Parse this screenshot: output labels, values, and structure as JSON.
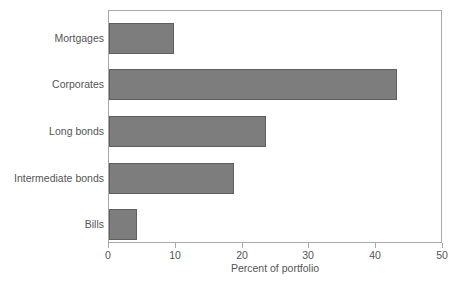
{
  "chart_data": {
    "type": "bar",
    "orientation": "horizontal",
    "title": "",
    "subtitle": "",
    "categories": [
      "Mortgages",
      "Corporates",
      "Long bonds",
      "Intermediate bonds",
      "Bills"
    ],
    "values": [
      9.8,
      43.1,
      23.5,
      18.7,
      4.2
    ],
    "xlabel": "Percent of portfolio",
    "ylabel": "",
    "xlim": [
      0,
      50
    ],
    "xticks": [
      0,
      10,
      20,
      30,
      40,
      50
    ],
    "xtick_labels": [
      "0",
      "10",
      "20",
      "30",
      "40",
      "50"
    ],
    "grid": false,
    "legend": null,
    "legend_position": "none",
    "series": [
      {
        "name": "Percent of portfolio",
        "values": [
          9.8,
          43.1,
          23.5,
          18.7,
          4.2
        ]
      }
    ],
    "annotations": []
  },
  "style": {
    "bar_fill": "#7d7d7d",
    "bar_border": "#5f5f5f",
    "frame_color": "#a8a8a8",
    "text_color": "#555555",
    "background": "#ffffff"
  }
}
